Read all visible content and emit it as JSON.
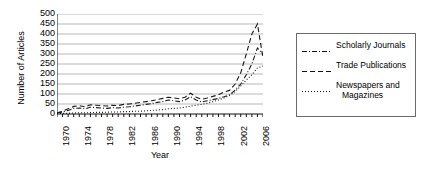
{
  "chart_data": {
    "type": "line",
    "title": "",
    "xlabel": "Year",
    "ylabel": "Number of Articles",
    "xlim": [
      1970,
      2007
    ],
    "ylim": [
      0,
      500
    ],
    "ytick_values": [
      0,
      50,
      100,
      150,
      200,
      250,
      300,
      350,
      400,
      450,
      500
    ],
    "ytick_labels": [
      "0",
      "50",
      "100",
      "150",
      "200",
      "250",
      "300",
      "350",
      "400",
      "450",
      "500"
    ],
    "xtick_labels": [
      "1970",
      "1974",
      "1978",
      "1982",
      "1986",
      "1990",
      "1994",
      "1998",
      "2002",
      "2006"
    ],
    "xtick_values": [
      1970,
      1974,
      1978,
      1982,
      1986,
      1990,
      1994,
      1998,
      2002,
      2006
    ],
    "minor_xticks_every": 1,
    "grid": "horizontal",
    "legend_position": "right-outside",
    "x": [
      1970,
      1971,
      1972,
      1973,
      1974,
      1975,
      1976,
      1977,
      1978,
      1979,
      1980,
      1981,
      1982,
      1983,
      1984,
      1985,
      1986,
      1987,
      1988,
      1989,
      1990,
      1991,
      1992,
      1993,
      1994,
      1995,
      1996,
      1997,
      1998,
      1999,
      2000,
      2001,
      2002,
      2003,
      2004,
      2005,
      2006,
      2007
    ],
    "series": [
      {
        "name": "Scholarly Journals",
        "linestyle": "dashdot",
        "color": "#1a1a1a",
        "values": [
          5,
          10,
          18,
          28,
          30,
          26,
          34,
          32,
          30,
          28,
          32,
          30,
          34,
          36,
          40,
          44,
          48,
          52,
          58,
          62,
          70,
          66,
          62,
          70,
          86,
          70,
          60,
          66,
          72,
          78,
          86,
          96,
          120,
          150,
          196,
          250,
          330,
          300
        ]
      },
      {
        "name": "Trade Publications",
        "linestyle": "dashed",
        "color": "#1a1a1a",
        "values": [
          6,
          14,
          26,
          38,
          42,
          36,
          46,
          44,
          42,
          40,
          44,
          42,
          48,
          50,
          54,
          58,
          62,
          66,
          72,
          78,
          84,
          80,
          76,
          84,
          104,
          84,
          74,
          80,
          88,
          96,
          110,
          118,
          150,
          206,
          300,
          400,
          450,
          280
        ]
      },
      {
        "name": "Newspapers and Magazines",
        "linestyle": "dotted",
        "color": "#1a1a1a",
        "values": [
          2,
          3,
          4,
          5,
          6,
          6,
          7,
          8,
          8,
          9,
          10,
          10,
          12,
          12,
          14,
          14,
          16,
          18,
          20,
          22,
          26,
          28,
          30,
          34,
          40,
          44,
          48,
          54,
          62,
          70,
          80,
          92,
          112,
          140,
          170,
          196,
          230,
          240
        ]
      }
    ]
  },
  "legend": {
    "items": [
      {
        "label": "Scholarly Journals",
        "label_line2": "",
        "style": "dashdot"
      },
      {
        "label": "Trade Publications",
        "label_line2": "",
        "style": "dashed"
      },
      {
        "label": "Newspapers and",
        "label_line2": "Magazines",
        "style": "dotted"
      }
    ]
  }
}
